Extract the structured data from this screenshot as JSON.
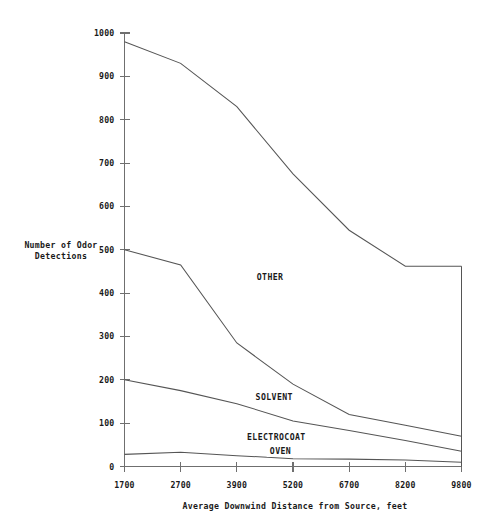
{
  "chart_data": {
    "type": "line",
    "title": "",
    "xlabel": "Average Downwind Distance from Source, feet",
    "ylabel": "Number of Odor Detections",
    "ylabel_line1": "Number of Odor",
    "ylabel_line2": "Detections",
    "categories": [
      "1700",
      "2700",
      "3900",
      "5200",
      "6700",
      "8200",
      "9800"
    ],
    "x": [
      1700,
      2700,
      3900,
      5200,
      6700,
      8200,
      9800
    ],
    "xtick_labels": [
      "1700",
      "2700",
      "3900",
      "5200",
      "6700",
      "8200",
      "9800"
    ],
    "ytick_labels": [
      "0",
      "100",
      "200",
      "300",
      "400",
      "500",
      "600",
      "700",
      "800",
      "900",
      "1000"
    ],
    "yticks": [
      0,
      100,
      200,
      300,
      400,
      500,
      600,
      700,
      800,
      900,
      1000
    ],
    "ylim": [
      0,
      1000
    ],
    "xlim": [
      1700,
      9800
    ],
    "grid": false,
    "legend_position": "inline-annotations",
    "series": [
      {
        "name": "OTHER",
        "label": "OTHER",
        "values": [
          980,
          930,
          830,
          675,
          545,
          462,
          462
        ],
        "label_x": 5200,
        "label_y": 430,
        "color": "#555555"
      },
      {
        "name": "SOLVENT",
        "label": "SOLVENT",
        "values": [
          500,
          465,
          285,
          190,
          120,
          95,
          70
        ],
        "label_x": 5300,
        "label_y": 153,
        "color": "#555555"
      },
      {
        "name": "ELECTROCOAT",
        "label": "ELECTROCOAT",
        "values": [
          200,
          175,
          145,
          105,
          83,
          60,
          35
        ],
        "label_x": 5350,
        "label_y": 62,
        "color": "#555555"
      },
      {
        "name": "OVEN",
        "label": "OVEN",
        "values": [
          28,
          33,
          25,
          18,
          17,
          15,
          10
        ],
        "label_x": 5450,
        "label_y": 29,
        "color": "#555555"
      }
    ],
    "annotations": [
      {
        "text": "OTHER",
        "series": "OTHER"
      },
      {
        "text": "SOLVENT",
        "series": "SOLVENT"
      },
      {
        "text": "ELECTROCOAT",
        "series": "ELECTROCOAT"
      },
      {
        "text": "OVEN",
        "series": "OVEN"
      }
    ],
    "axis_color": "#6f6f6f",
    "line_color": "#555555",
    "background": "#ffffff"
  }
}
